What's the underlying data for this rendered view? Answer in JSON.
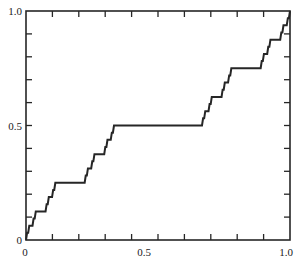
{
  "chart_data": {
    "type": "line",
    "title": "",
    "subtitle": "",
    "xlabel": "",
    "ylabel": "",
    "xlim": [
      0,
      1
    ],
    "ylim": [
      0,
      1
    ],
    "grid": false,
    "legend": false,
    "legend_position": "none",
    "x_ticks": [
      0,
      0.1,
      0.2,
      0.3,
      0.4,
      0.5,
      0.6,
      0.7,
      0.8,
      0.9,
      1.0
    ],
    "y_ticks": [
      0,
      0.1,
      0.2,
      0.3,
      0.4,
      0.5,
      0.6,
      0.7,
      0.8,
      0.9,
      1.0
    ],
    "x_tick_labels": [
      "0",
      "",
      "",
      "",
      "",
      "0.5",
      "",
      "",
      "",
      "",
      "1.0"
    ],
    "y_tick_labels": [
      "0",
      "",
      "",
      "",
      "",
      "0.5",
      "",
      "",
      "",
      "",
      "1.0"
    ],
    "tick_direction": "in",
    "recursion_depth": 5,
    "line_color": "#262626",
    "line_width": 2,
    "axis_color": "#262626",
    "background_color": "#ffffff",
    "plateaus": [
      {
        "y": 0.5,
        "x_start": 0.333333,
        "x_end": 0.666667
      },
      {
        "y": 0.25,
        "x_start": 0.111111,
        "x_end": 0.222222
      },
      {
        "y": 0.75,
        "x_start": 0.777778,
        "x_end": 0.888889
      },
      {
        "y": 0.125,
        "x_start": 0.037037,
        "x_end": 0.074074
      },
      {
        "y": 0.375,
        "x_start": 0.259259,
        "x_end": 0.296296
      },
      {
        "y": 0.625,
        "x_start": 0.703704,
        "x_end": 0.740741
      },
      {
        "y": 0.875,
        "x_start": 0.925926,
        "x_end": 0.962963
      }
    ]
  },
  "labels": {
    "y_top": "1.0",
    "y_mid": "0.5",
    "y_bottom": "0",
    "x_left": "0",
    "x_mid": "0.5",
    "x_right": "1.0"
  }
}
